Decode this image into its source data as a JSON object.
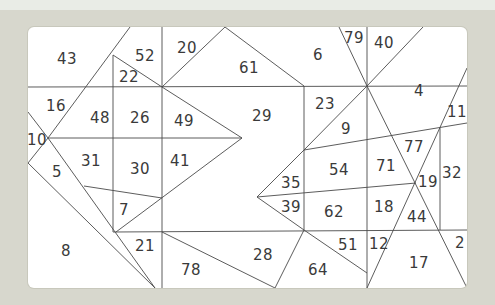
{
  "puzzle": {
    "background_color": "#d7d7cd",
    "panel_color": "#ffffff",
    "line_color": "#4a4a4a",
    "regions": [
      {
        "label": "43",
        "x": 67,
        "y": 59
      },
      {
        "label": "52",
        "x": 145,
        "y": 56
      },
      {
        "label": "20",
        "x": 187,
        "y": 48
      },
      {
        "label": "22",
        "x": 129,
        "y": 77
      },
      {
        "label": "61",
        "x": 249,
        "y": 68
      },
      {
        "label": "6",
        "x": 318,
        "y": 55
      },
      {
        "label": "79",
        "x": 354,
        "y": 38
      },
      {
        "label": "40",
        "x": 384,
        "y": 43
      },
      {
        "label": "4",
        "x": 419,
        "y": 91
      },
      {
        "label": "11",
        "x": 457,
        "y": 112
      },
      {
        "label": "16",
        "x": 56,
        "y": 106
      },
      {
        "label": "48",
        "x": 100,
        "y": 118
      },
      {
        "label": "26",
        "x": 140,
        "y": 118
      },
      {
        "label": "49",
        "x": 184,
        "y": 121
      },
      {
        "label": "29",
        "x": 262,
        "y": 116
      },
      {
        "label": "23",
        "x": 325,
        "y": 104
      },
      {
        "label": "9",
        "x": 346,
        "y": 129
      },
      {
        "label": "10",
        "x": 37,
        "y": 140
      },
      {
        "label": "31",
        "x": 91,
        "y": 161
      },
      {
        "label": "30",
        "x": 140,
        "y": 169
      },
      {
        "label": "41",
        "x": 180,
        "y": 161
      },
      {
        "label": "77",
        "x": 414,
        "y": 147
      },
      {
        "label": "54",
        "x": 339,
        "y": 170
      },
      {
        "label": "71",
        "x": 386,
        "y": 166
      },
      {
        "label": "32",
        "x": 452,
        "y": 173
      },
      {
        "label": "5",
        "x": 57,
        "y": 172
      },
      {
        "label": "35",
        "x": 291,
        "y": 183
      },
      {
        "label": "19",
        "x": 428,
        "y": 182
      },
      {
        "label": "39",
        "x": 291,
        "y": 207
      },
      {
        "label": "62",
        "x": 334,
        "y": 212
      },
      {
        "label": "18",
        "x": 384,
        "y": 207
      },
      {
        "label": "44",
        "x": 417,
        "y": 217
      },
      {
        "label": "7",
        "x": 124,
        "y": 210
      },
      {
        "label": "8",
        "x": 66,
        "y": 251
      },
      {
        "label": "21",
        "x": 145,
        "y": 246
      },
      {
        "label": "78",
        "x": 191,
        "y": 270
      },
      {
        "label": "28",
        "x": 263,
        "y": 255
      },
      {
        "label": "51",
        "x": 348,
        "y": 245
      },
      {
        "label": "12",
        "x": 379,
        "y": 244
      },
      {
        "label": "64",
        "x": 318,
        "y": 270
      },
      {
        "label": "17",
        "x": 419,
        "y": 263
      },
      {
        "label": "2",
        "x": 460,
        "y": 243
      }
    ]
  }
}
